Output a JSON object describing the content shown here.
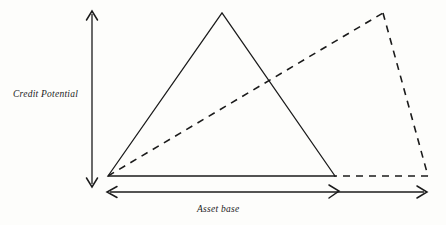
{
  "figure": {
    "type": "line-diagram",
    "background_color": "#fdfdfb",
    "stroke_color": "#1b1b1b",
    "axes": {
      "vertical": {
        "label": "Credit Potential",
        "orientation": "vertical",
        "arrowheads": "both",
        "x": 92,
        "y_top": 12,
        "y_bottom": 186
      },
      "horizontal": {
        "label": "Asset base",
        "orientation": "horizontal",
        "arrowheads": "both",
        "y": 192,
        "x_left": 108,
        "x_right": 426,
        "interior_arrow_x": 338
      }
    },
    "shapes": [
      {
        "name": "solid-triangle",
        "style": "solid",
        "points": "108,176 222,13 335,176",
        "closed": true,
        "description": "Solid triangle representing original credit potential over asset base"
      },
      {
        "name": "dashed-quadrilateral",
        "style": "dashed",
        "points": "108,176 383,13 428,176 335,176",
        "closed": true,
        "description": "Dashed quadrilateral representing expanded asset base with flatter credit potential"
      }
    ],
    "vertices": {
      "origin": [
        108,
        176
      ],
      "triangle_apex": [
        222,
        13
      ],
      "triangle_base_right": [
        335,
        176
      ],
      "dashed_apex": [
        383,
        13
      ],
      "dashed_base_right": [
        428,
        176
      ]
    }
  },
  "labels": {
    "vertical_axis": "Credit Potential",
    "horizontal_axis": "Asset base"
  }
}
